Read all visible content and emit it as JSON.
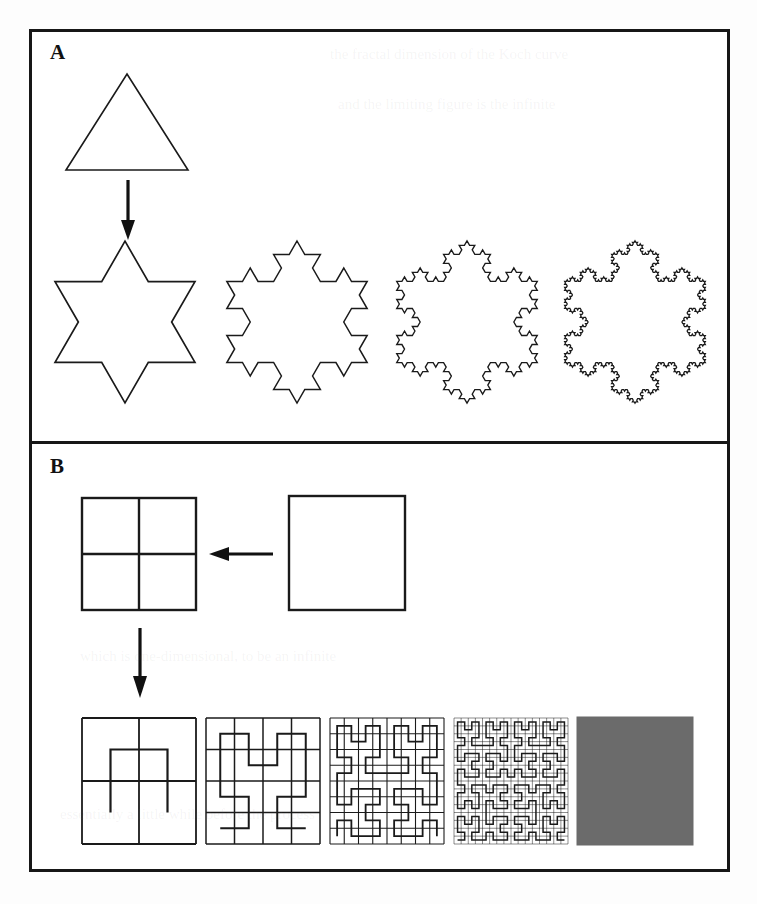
{
  "figure": {
    "caption_absent": true,
    "background_color": "#fdfdfd",
    "frame_color": "#171717",
    "ink_color": "#1a1a1a",
    "fill_gray": "#6b6b6b"
  },
  "panels": [
    {
      "id": "A",
      "label": "A",
      "subject": "koch-snowflake-construction",
      "initiator": {
        "name": "equilateral-triangle",
        "sides": 3
      },
      "arrow": {
        "direction": "down",
        "from": "triangle",
        "to": "iteration-1"
      },
      "iterations": [
        {
          "order": 1,
          "name": "koch-iteration-1",
          "segments": 12,
          "label_visible": false
        },
        {
          "order": 2,
          "name": "koch-iteration-2",
          "segments": 48,
          "label_visible": false
        },
        {
          "order": 3,
          "name": "koch-iteration-3",
          "segments": 192,
          "label_visible": false
        },
        {
          "order": 4,
          "name": "koch-iteration-4",
          "segments": 768,
          "label_visible": false
        }
      ]
    },
    {
      "id": "B",
      "label": "B",
      "subject": "hilbert-curve-space-filling-construction",
      "initiator": {
        "name": "plain-square"
      },
      "quartered": {
        "name": "quartered-square"
      },
      "arrow_left": {
        "direction": "left",
        "from": "plain-square",
        "to": "quartered-square"
      },
      "arrow_down": {
        "direction": "down",
        "from": "quartered-square",
        "to": "hilbert-iteration-1"
      },
      "iterations": [
        {
          "order": 1,
          "name": "hilbert-iteration-1",
          "label_visible": false
        },
        {
          "order": 2,
          "name": "hilbert-iteration-2",
          "label_visible": false
        },
        {
          "order": 3,
          "name": "hilbert-iteration-3",
          "label_visible": false
        },
        {
          "order": 4,
          "name": "hilbert-iteration-4",
          "label_visible": false
        },
        {
          "order": 5,
          "name": "hilbert-limit-filled-square",
          "label_visible": false,
          "filled": true
        }
      ]
    }
  ],
  "ghost_lines": [
    {
      "text": "the fractal dimension of the Koch curve",
      "x": 330,
      "y": 46
    },
    {
      "text": "and the limiting figure is the infinite",
      "x": 338,
      "y": 96
    },
    {
      "text": "which is one-dimensional, to be an infinite",
      "x": 80,
      "y": 648
    },
    {
      "text": "essentially a little while before the process",
      "x": 60,
      "y": 806
    }
  ]
}
